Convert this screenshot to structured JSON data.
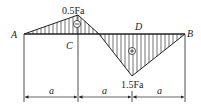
{
  "diagram": {
    "type": "bending-moment-diagram",
    "points": {
      "A": "A",
      "B": "B",
      "C": "C",
      "D": "D"
    },
    "values": {
      "max_negative": "0.5Fa",
      "max_positive": "1.5Fa"
    },
    "signs": {
      "left": "⊖",
      "right": "⊕"
    },
    "dimensions": [
      "a",
      "a",
      "a"
    ],
    "colors": {
      "line": "#222222",
      "hatch": "#333333"
    }
  }
}
